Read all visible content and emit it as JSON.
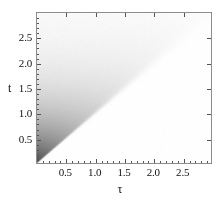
{
  "figure": {
    "kind": "density-plot",
    "background": "#ffffff",
    "frame_color": "#8d8d8d"
  },
  "axes": {
    "x": {
      "title": "τ",
      "ticks": [
        {
          "value": 0.5,
          "label": "0.5"
        },
        {
          "value": 1.0,
          "label": "1.0"
        },
        {
          "value": 1.5,
          "label": "1.5"
        },
        {
          "value": 2.0,
          "label": "2.0"
        },
        {
          "value": 2.5,
          "label": "2.5"
        }
      ],
      "minor_ticks": [
        0.1,
        0.2,
        0.3,
        0.4,
        0.6,
        0.7,
        0.8,
        0.9,
        1.1,
        1.2,
        1.3,
        1.4,
        1.6,
        1.7,
        1.8,
        1.9,
        2.1,
        2.2,
        2.3,
        2.4,
        2.6,
        2.7,
        2.8,
        2.9
      ],
      "range": [
        0,
        3
      ]
    },
    "y": {
      "title": "t",
      "ticks": [
        {
          "value": 0.5,
          "label": "0.5"
        },
        {
          "value": 1.0,
          "label": "1.0"
        },
        {
          "value": 1.5,
          "label": "1.5"
        },
        {
          "value": 2.0,
          "label": "2.0"
        },
        {
          "value": 2.5,
          "label": "2.5"
        }
      ],
      "minor_ticks": [
        0.1,
        0.2,
        0.3,
        0.4,
        0.6,
        0.7,
        0.8,
        0.9,
        1.1,
        1.2,
        1.3,
        1.4,
        1.6,
        1.7,
        1.8,
        1.9,
        2.1,
        2.2,
        2.3,
        2.4,
        2.6,
        2.7,
        2.8,
        2.9
      ],
      "range": [
        0,
        3
      ]
    }
  },
  "chart_data": {
    "type": "heatmap",
    "title": "",
    "subtitle": "",
    "xlabel": "τ",
    "ylabel": "t",
    "xlim": [
      0,
      3
    ],
    "ylim": [
      0,
      3
    ],
    "grid": false,
    "legend": "none",
    "colormap": "grayscale",
    "colormap_low_value_color": "#ffffff",
    "colormap_high_value_color": "#000000",
    "value_range": [
      0,
      1
    ],
    "support_region": "t >= tau (upper-left triangle); value is 0 below the diagonal t = tau",
    "x": [
      0.0,
      0.25,
      0.5,
      0.75,
      1.0,
      1.25,
      1.5,
      1.75,
      2.0,
      2.25,
      2.5,
      2.75,
      3.0
    ],
    "y": [
      0.0,
      0.25,
      0.5,
      0.75,
      1.0,
      1.25,
      1.5,
      1.75,
      2.0,
      2.25,
      2.5,
      2.75,
      3.0
    ],
    "z": [
      [
        1.0,
        0.0,
        0.0,
        0.0,
        0.0,
        0.0,
        0.0,
        0.0,
        0.0,
        0.0,
        0.0,
        0.0,
        0.0
      ],
      [
        0.92,
        0.88,
        0.0,
        0.0,
        0.0,
        0.0,
        0.0,
        0.0,
        0.0,
        0.0,
        0.0,
        0.0,
        0.0
      ],
      [
        0.82,
        0.79,
        0.76,
        0.0,
        0.0,
        0.0,
        0.0,
        0.0,
        0.0,
        0.0,
        0.0,
        0.0,
        0.0
      ],
      [
        0.71,
        0.69,
        0.66,
        0.63,
        0.0,
        0.0,
        0.0,
        0.0,
        0.0,
        0.0,
        0.0,
        0.0,
        0.0
      ],
      [
        0.61,
        0.59,
        0.57,
        0.54,
        0.51,
        0.0,
        0.0,
        0.0,
        0.0,
        0.0,
        0.0,
        0.0,
        0.0
      ],
      [
        0.51,
        0.49,
        0.47,
        0.45,
        0.43,
        0.41,
        0.0,
        0.0,
        0.0,
        0.0,
        0.0,
        0.0,
        0.0
      ],
      [
        0.42,
        0.4,
        0.38,
        0.37,
        0.35,
        0.33,
        0.31,
        0.0,
        0.0,
        0.0,
        0.0,
        0.0,
        0.0
      ],
      [
        0.33,
        0.31,
        0.3,
        0.29,
        0.27,
        0.26,
        0.24,
        0.22,
        0.0,
        0.0,
        0.0,
        0.0,
        0.0
      ],
      [
        0.25,
        0.24,
        0.23,
        0.22,
        0.21,
        0.19,
        0.18,
        0.16,
        0.14,
        0.0,
        0.0,
        0.0,
        0.0
      ],
      [
        0.18,
        0.17,
        0.16,
        0.15,
        0.14,
        0.13,
        0.12,
        0.1,
        0.08,
        0.0,
        0.0,
        0.0,
        0.0
      ],
      [
        0.12,
        0.11,
        0.11,
        0.1,
        0.09,
        0.08,
        0.07,
        0.06,
        0.04,
        0.0,
        0.0,
        0.0,
        0.0
      ],
      [
        0.07,
        0.06,
        0.06,
        0.05,
        0.05,
        0.04,
        0.04,
        0.03,
        0.02,
        0.0,
        0.0,
        0.0,
        0.0
      ],
      [
        0.03,
        0.03,
        0.03,
        0.02,
        0.02,
        0.02,
        0.01,
        0.01,
        0.01,
        0.0,
        0.0,
        0.0,
        0.0
      ]
    ]
  }
}
